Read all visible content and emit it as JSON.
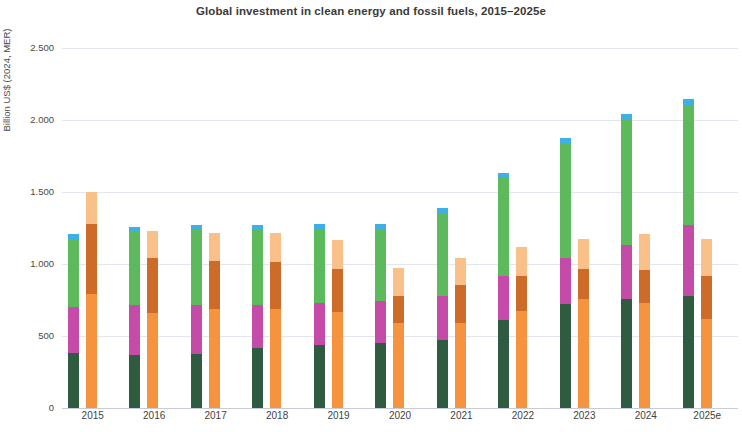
{
  "chart_data": {
    "type": "bar",
    "title": "Global investment in clean energy and fossil fuels, 2015–2025e",
    "xlabel": "",
    "ylabel": "Billion US$ (2024, MER)",
    "ylim": [
      0,
      2500
    ],
    "ytick_labels": [
      "0",
      "500",
      "1.000",
      "1.500",
      "2.000",
      "2.500"
    ],
    "ytick_values": [
      0,
      500,
      1000,
      1500,
      2000,
      2500
    ],
    "grid": true,
    "legend_position": "none",
    "categories": [
      "2015",
      "2016",
      "2017",
      "2018",
      "2019",
      "2020",
      "2021",
      "2022",
      "2023",
      "2024",
      "2025e"
    ],
    "bar_groups": [
      {
        "name": "Clean energy",
        "series": [
          {
            "name": "Renewable power",
            "color": "#2f5c40",
            "values": [
              380,
              370,
              375,
              420,
              440,
              450,
              475,
              610,
              720,
              760,
              780
            ]
          },
          {
            "name": "Grids and storage",
            "color": "#c44ba8",
            "values": [
              320,
              345,
              340,
              295,
              290,
              295,
              300,
              310,
              320,
              375,
              490
            ]
          },
          {
            "name": "Efficiency and end-use",
            "color": "#5cb95c",
            "values": [
              470,
              510,
              520,
              520,
              510,
              490,
              575,
              680,
              800,
              870,
              835
            ]
          },
          {
            "name": "Other clean energy",
            "color": "#3eb0e5",
            "values": [
              40,
              35,
              35,
              35,
              40,
              40,
              40,
              35,
              35,
              35,
              40
            ]
          }
        ]
      },
      {
        "name": "Fossil fuels",
        "series": [
          {
            "name": "Oil and gas upstream",
            "color": "#f5933f",
            "values": [
              790,
              660,
              690,
              690,
              665,
              590,
              590,
              675,
              760,
              730,
              620
            ]
          },
          {
            "name": "Fossil fuel supply, other",
            "color": "#cd6b28",
            "values": [
              490,
              380,
              330,
              325,
              300,
              190,
              265,
              240,
              205,
              230,
              300
            ]
          },
          {
            "name": "Unabated fossil fuel power",
            "color": "#fac08a",
            "values": [
              220,
              190,
              195,
              200,
              205,
              195,
              185,
              200,
              210,
              250,
              255
            ]
          }
        ]
      }
    ]
  }
}
